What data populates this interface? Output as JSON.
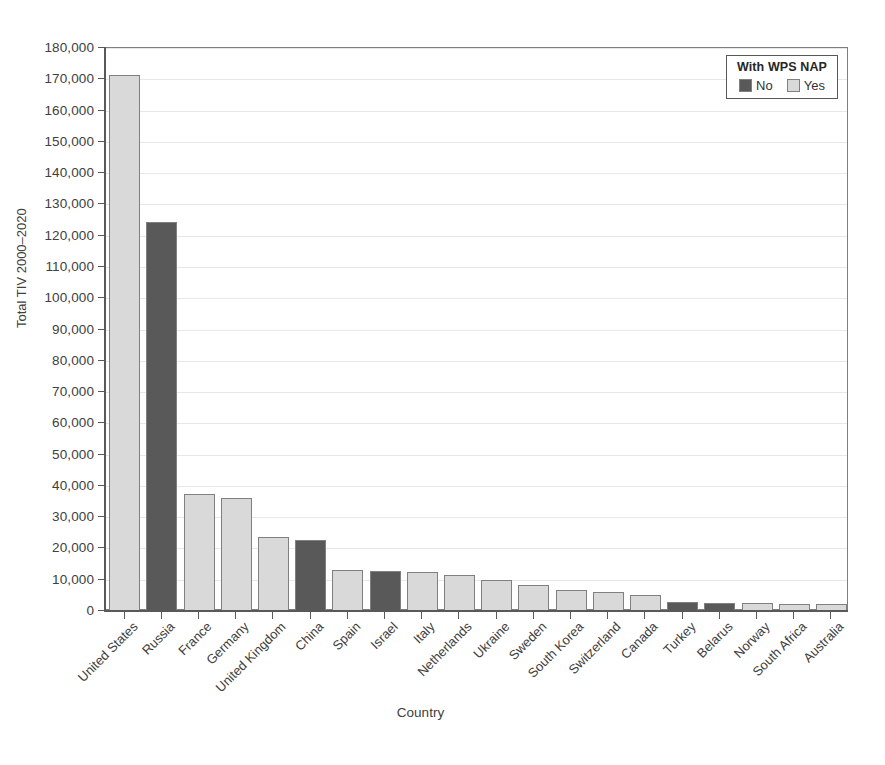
{
  "chart_data": {
    "type": "bar",
    "title": "",
    "xlabel": "Country",
    "ylabel": "Total TIV 2000–2020",
    "ylim": [
      0,
      180000
    ],
    "y_tick_step": 10000,
    "grid": true,
    "categories": [
      "United States",
      "Russia",
      "France",
      "Germany",
      "United Kingdom",
      "China",
      "Spain",
      "Israel",
      "Italy",
      "Netherlands",
      "Ukraine",
      "Sweden",
      "South Korea",
      "Switzerland",
      "Canada",
      "Turkey",
      "Belarus",
      "Norway",
      "South Africa",
      "Australia"
    ],
    "values": [
      171500,
      124300,
      37500,
      36000,
      23700,
      22600,
      13000,
      12700,
      12600,
      11500,
      9900,
      8300,
      6800,
      6100,
      5000,
      2900,
      2600,
      2400,
      2300,
      2100
    ],
    "group": [
      "Yes",
      "No",
      "Yes",
      "Yes",
      "Yes",
      "No",
      "Yes",
      "No",
      "Yes",
      "Yes",
      "Yes",
      "Yes",
      "Yes",
      "Yes",
      "Yes",
      "No",
      "No",
      "Yes",
      "Yes",
      "Yes"
    ],
    "y_tick_labels": [
      "0",
      "10,000",
      "20,000",
      "30,000",
      "40,000",
      "50,000",
      "60,000",
      "70,000",
      "80,000",
      "90,000",
      "100,000",
      "110,000",
      "120,000",
      "130,000",
      "140,000",
      "150,000",
      "160,000",
      "170,000",
      "180,000"
    ],
    "legend": {
      "title": "With WPS NAP",
      "position": "top-right",
      "entries": [
        {
          "label": "No",
          "color": "#595959"
        },
        {
          "label": "Yes",
          "color": "#d9d9d9"
        }
      ]
    },
    "colors": {
      "no": "#595959",
      "yes": "#d9d9d9",
      "bar_outline": "#808080",
      "axis": "#595959",
      "grid": "#e8e8e8",
      "text": "#404040",
      "background": "#ffffff"
    }
  }
}
